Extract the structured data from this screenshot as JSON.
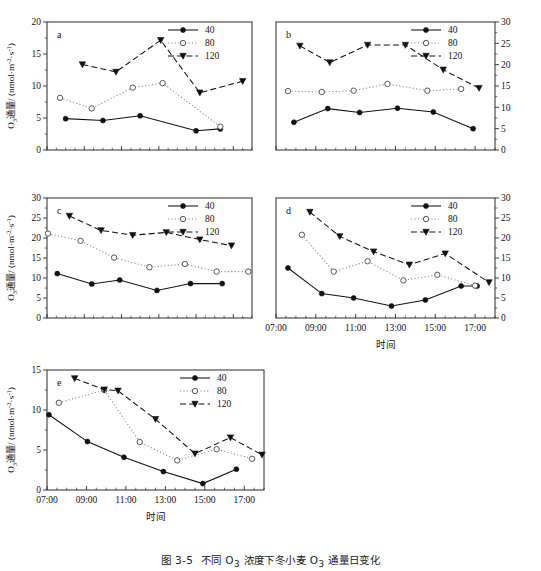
{
  "figure": {
    "caption": "图 3-5  不同 O3 浓度下冬小麦 O3 通量日变化",
    "xlabel": "时间",
    "ylabel": "O3 通量/ (nmol·m-2·s-1)"
  },
  "legend": {
    "items": [
      {
        "label": "40",
        "style": "solid-filled-circle"
      },
      {
        "label": "80",
        "style": "dotted-open-circle"
      },
      {
        "label": "120",
        "style": "dashed-filled-triangle"
      }
    ]
  },
  "xticks": [
    "07:00",
    "09:00",
    "11:00",
    "13:00",
    "15:00",
    "17:00"
  ],
  "chart_data": [
    {
      "type": "line",
      "panel": "a",
      "title": "a",
      "xlabel": "时间",
      "ylabel": "O3 通量/ (nmol·m-2·s-1)",
      "x": [
        "08:00",
        "10:00",
        "12:00",
        "13:00",
        "15:00",
        "16:00",
        "17:30"
      ],
      "xnum": [
        8.0,
        10.0,
        12.0,
        13.0,
        15.0,
        16.0,
        17.6
      ],
      "ylim": [
        0,
        20
      ],
      "yticks": [
        0,
        5,
        10,
        15,
        20
      ],
      "xlim": [
        7,
        18
      ],
      "grid": false,
      "legend_position": "top-right",
      "series": [
        {
          "name": "40",
          "values": [
            4.9,
            4.6,
            5.35,
            null,
            3.0,
            3.3,
            null
          ]
        },
        {
          "name": "80",
          "values": [
            8.15,
            6.5,
            9.75,
            10.45,
            null,
            3.65,
            null
          ]
        },
        {
          "name": "120",
          "values": [
            13.35,
            12.2,
            null,
            17.15,
            8.95,
            null,
            10.75
          ]
        }
      ],
      "series_x": {
        "40": [
          8.0,
          10.0,
          12.0,
          15.0,
          16.3
        ],
        "80": [
          7.7,
          9.4,
          11.6,
          13.2,
          16.3
        ],
        "120": [
          8.9,
          10.7,
          13.1,
          15.2,
          17.5
        ]
      },
      "series_y": {
        "40": [
          4.9,
          4.6,
          5.35,
          3.0,
          3.3
        ],
        "80": [
          8.15,
          6.5,
          9.75,
          10.45,
          3.65
        ],
        "120": [
          13.35,
          12.2,
          17.15,
          8.95,
          10.75
        ]
      }
    },
    {
      "type": "line",
      "panel": "b",
      "title": "b",
      "xlabel": "时间",
      "ylabel": "O3 通量/ (nmol·m-2·s-1)",
      "ylim": [
        0,
        30
      ],
      "yticks": [
        0,
        5,
        10,
        15,
        20,
        25,
        30
      ],
      "xlim": [
        7,
        18
      ],
      "yaxis_side": "right",
      "grid": false,
      "legend_position": "top-right",
      "series_x": {
        "40": [
          7.9,
          9.6,
          11.2,
          13.1,
          14.9,
          16.9
        ],
        "80": [
          7.6,
          9.3,
          10.9,
          12.6,
          14.6,
          16.3
        ],
        "120": [
          8.2,
          9.7,
          11.6,
          13.5,
          15.4,
          17.2
        ]
      },
      "series_y": {
        "40": [
          6.5,
          9.7,
          8.8,
          9.8,
          8.9,
          5.0
        ],
        "80": [
          13.8,
          13.6,
          13.9,
          15.5,
          13.9,
          14.3
        ],
        "120": [
          24.4,
          20.5,
          24.6,
          24.6,
          18.8,
          14.5
        ]
      }
    },
    {
      "type": "line",
      "panel": "c",
      "title": "c",
      "xlabel": "时间",
      "ylabel": "O3 通量/ (nmol·m-2·s-1)",
      "ylim": [
        0,
        30
      ],
      "yticks": [
        0,
        5,
        10,
        15,
        20,
        25,
        30
      ],
      "xlim": [
        7,
        18
      ],
      "grid": false,
      "legend_position": "top-right",
      "series_x": {
        "40": [
          7.55,
          9.4,
          10.9,
          12.9,
          14.7,
          16.4
        ],
        "80": [
          7.05,
          8.8,
          10.6,
          12.5,
          14.4,
          16.1,
          17.8
        ],
        "120": [
          8.2,
          9.9,
          11.6,
          13.4,
          15.2,
          16.9
        ]
      },
      "series_y": {
        "40": [
          11.1,
          8.5,
          9.5,
          6.9,
          8.6,
          8.6
        ],
        "80": [
          21.1,
          19.3,
          15.1,
          12.7,
          13.5,
          11.6,
          11.6
        ],
        "120": [
          25.5,
          21.9,
          20.7,
          21.4,
          19.6,
          18.1
        ]
      }
    },
    {
      "type": "line",
      "panel": "d",
      "title": "d",
      "xlabel": "时间",
      "ylabel": "O3 通量/ (nmol·m-2·s-1)",
      "ylim": [
        0,
        30
      ],
      "yticks": [
        0,
        5,
        10,
        15,
        20,
        25,
        30
      ],
      "xlim": [
        7,
        18
      ],
      "yaxis_side": "right",
      "grid": false,
      "legend_position": "top-right",
      "series_x": {
        "40": [
          7.6,
          9.3,
          10.9,
          12.8,
          14.5,
          16.3,
          17.1
        ],
        "80": [
          8.3,
          9.9,
          11.6,
          13.4,
          15.1,
          17.0
        ],
        "120": [
          8.7,
          10.2,
          11.9,
          13.7,
          15.5,
          17.7
        ]
      },
      "series_y": {
        "40": [
          12.5,
          6.1,
          5.0,
          3.0,
          4.5,
          8.0,
          8.0
        ],
        "80": [
          20.8,
          11.6,
          14.2,
          9.4,
          10.8,
          8.1
        ],
        "120": [
          26.5,
          20.4,
          16.6,
          13.3,
          16.1,
          8.9
        ]
      }
    },
    {
      "type": "line",
      "panel": "e",
      "title": "e",
      "xlabel": "时间",
      "ylabel": "O3 通量/ (nmol·m-2·s-1)",
      "ylim": [
        0,
        15
      ],
      "yticks": [
        0,
        5,
        10,
        15
      ],
      "xlim": [
        7,
        18
      ],
      "grid": false,
      "legend_position": "top-right",
      "series_x": {
        "40": [
          7.1,
          9.05,
          10.9,
          12.9,
          14.9,
          16.6
        ],
        "80": [
          7.6,
          9.9,
          11.7,
          13.6,
          15.6,
          17.4
        ],
        "120": [
          8.4,
          9.9,
          10.6,
          12.5,
          14.5,
          16.3,
          17.9
        ]
      },
      "series_y": {
        "40": [
          9.4,
          6.05,
          4.1,
          2.3,
          0.8,
          2.6
        ],
        "80": [
          10.9,
          12.5,
          6.0,
          3.7,
          5.1,
          3.9
        ],
        "120": [
          13.95,
          12.55,
          12.4,
          8.85,
          4.55,
          6.55,
          4.4
        ]
      }
    }
  ]
}
